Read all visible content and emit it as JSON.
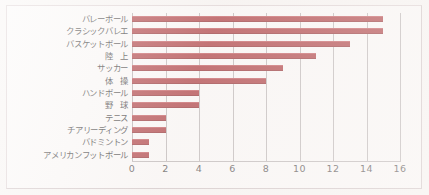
{
  "figure": {
    "background_color": "#f8f5f3",
    "frame_color": "#ddd1d2",
    "bar_color": "#a83236",
    "gridline_color": "#b9b3b3"
  },
  "chart_data": {
    "type": "bar",
    "orientation": "horizontal",
    "title": "",
    "subtitle": "",
    "xlabel": "",
    "ylabel": "",
    "xlim": [
      0,
      16
    ],
    "xticks": [
      0,
      2,
      4,
      6,
      8,
      10,
      12,
      14,
      16
    ],
    "xtick_labels": [
      "0",
      "2",
      "4",
      "6",
      "8",
      "10",
      "12",
      "14",
      "16"
    ],
    "grid": "vertical",
    "legend": null,
    "legend_position": "none",
    "categories": [
      "バレーボール",
      "クラシックバレエ",
      "バスケットボール",
      "陸　上",
      "サッカー",
      "体　操",
      "ハンドボール",
      "野　球",
      "テニス",
      "チアリーディング",
      "バドミントン",
      "アメリカンフットボール"
    ],
    "values": [
      15,
      15,
      13,
      11,
      9,
      8,
      4,
      4,
      2,
      2,
      1,
      1
    ],
    "annotations": []
  }
}
